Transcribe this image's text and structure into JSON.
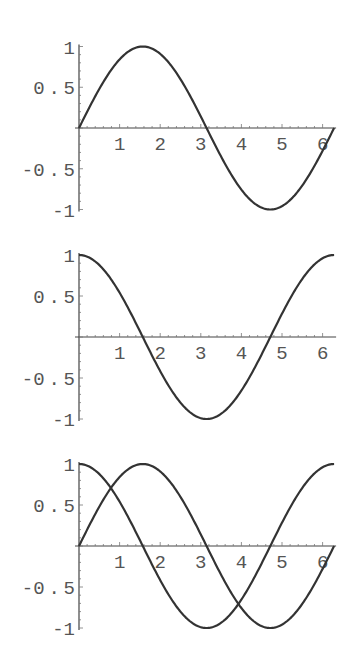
{
  "chart_data": [
    {
      "type": "line",
      "title": "",
      "xlabel": "",
      "ylabel": "",
      "xlim": [
        0,
        6.2832
      ],
      "ylim": [
        -1,
        1
      ],
      "x_ticks": [
        "1",
        "2",
        "3",
        "4",
        "5",
        "6"
      ],
      "y_ticks": [
        "1",
        "0.5",
        "-0.5",
        "-1"
      ],
      "grid": false,
      "series": [
        {
          "name": "sin(x)",
          "function": "sin",
          "x": [
            0,
            0.5,
            1,
            1.5,
            2,
            2.5,
            3,
            3.5,
            4,
            4.5,
            5,
            5.5,
            6,
            6.28
          ],
          "values": [
            0,
            0.48,
            0.84,
            1.0,
            0.91,
            0.6,
            0.14,
            -0.35,
            -0.76,
            -0.98,
            -0.96,
            -0.71,
            -0.28,
            0
          ]
        }
      ]
    },
    {
      "type": "line",
      "title": "",
      "xlabel": "",
      "ylabel": "",
      "xlim": [
        0,
        6.2832
      ],
      "ylim": [
        -1,
        1
      ],
      "x_ticks": [
        "1",
        "2",
        "3",
        "4",
        "5",
        "6"
      ],
      "y_ticks": [
        "1",
        "0.5",
        "-0.5",
        "-1"
      ],
      "grid": false,
      "series": [
        {
          "name": "cos(x)",
          "function": "cos",
          "x": [
            0,
            0.5,
            1,
            1.5,
            2,
            2.5,
            3,
            3.5,
            4,
            4.5,
            5,
            5.5,
            6,
            6.28
          ],
          "values": [
            1,
            0.88,
            0.54,
            0.07,
            -0.42,
            -0.8,
            -0.99,
            -0.94,
            -0.65,
            -0.21,
            0.28,
            0.71,
            0.96,
            1
          ]
        }
      ]
    },
    {
      "type": "line",
      "title": "",
      "xlabel": "",
      "ylabel": "",
      "xlim": [
        0,
        6.2832
      ],
      "ylim": [
        -1,
        1
      ],
      "x_ticks": [
        "1",
        "2",
        "3",
        "4",
        "5",
        "6"
      ],
      "y_ticks": [
        "1",
        "0.5",
        "-0.5",
        "-1"
      ],
      "grid": false,
      "series": [
        {
          "name": "sin(x)",
          "function": "sin",
          "x": [
            0,
            0.5,
            1,
            1.5,
            2,
            2.5,
            3,
            3.5,
            4,
            4.5,
            5,
            5.5,
            6,
            6.28
          ],
          "values": [
            0,
            0.48,
            0.84,
            1.0,
            0.91,
            0.6,
            0.14,
            -0.35,
            -0.76,
            -0.98,
            -0.96,
            -0.71,
            -0.28,
            0
          ]
        },
        {
          "name": "cos(x)",
          "function": "cos",
          "x": [
            0,
            0.5,
            1,
            1.5,
            2,
            2.5,
            3,
            3.5,
            4,
            4.5,
            5,
            5.5,
            6,
            6.28
          ],
          "values": [
            1,
            0.88,
            0.54,
            0.07,
            -0.42,
            -0.8,
            -0.99,
            -0.94,
            -0.65,
            -0.21,
            0.28,
            0.71,
            0.96,
            1
          ]
        }
      ]
    }
  ],
  "layout": {
    "panels": [
      {
        "zero_y": 128,
        "unit_y": 81.5
      },
      {
        "zero_y": 337,
        "unit_y": 82
      },
      {
        "zero_y": 546,
        "unit_y": 82
      }
    ],
    "origin_x": 79,
    "unit_x": 40.6,
    "curve_color": "#333333",
    "axis_color": "#444444",
    "label_color": "#555555"
  }
}
